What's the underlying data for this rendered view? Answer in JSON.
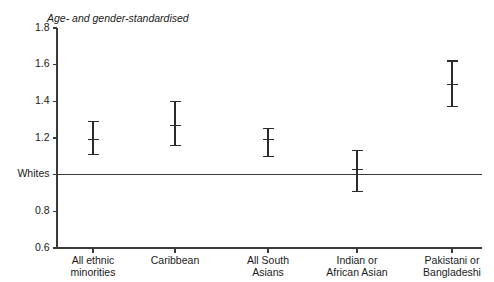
{
  "chart_data": {
    "type": "scatter",
    "title": "Age- and gender-standardised",
    "xlabel": "",
    "ylabel": "",
    "ylim": [
      0.6,
      1.8
    ],
    "grid": false,
    "legend": null,
    "y_ticks": [
      {
        "value": 1.8,
        "label": "1.8"
      },
      {
        "value": 1.6,
        "label": "1.6"
      },
      {
        "value": 1.4,
        "label": "1.4"
      },
      {
        "value": 1.2,
        "label": "1.2"
      },
      {
        "value": 1.0,
        "label": "Whites"
      },
      {
        "value": 0.8,
        "label": "0.8"
      },
      {
        "value": 0.6,
        "label": "0.6"
      }
    ],
    "reference_line": {
      "value": 1.0,
      "label": "Whites"
    },
    "categories": [
      "All ethnic minorities",
      "Caribbean",
      "All South Asians",
      "Indian or African Asian",
      "Pakistani or Bangladeshi"
    ],
    "category_label_lines": [
      [
        "All ethnic",
        "minorities"
      ],
      [
        "Caribbean"
      ],
      [
        "All South",
        "Asians"
      ],
      [
        "Indian or",
        "African Asian"
      ],
      [
        "Pakistani or",
        "Bangladeshi"
      ]
    ],
    "values": [
      1.19,
      1.27,
      1.19,
      1.03,
      1.49
    ],
    "ci_low": [
      1.11,
      1.16,
      1.1,
      0.91,
      1.37
    ],
    "ci_high": [
      1.29,
      1.4,
      1.25,
      1.13,
      1.62
    ],
    "points": [
      {
        "category": "All ethnic minorities",
        "value": 1.19,
        "low": 1.11,
        "high": 1.29
      },
      {
        "category": "Caribbean",
        "value": 1.27,
        "low": 1.16,
        "high": 1.4
      },
      {
        "category": "All South Asians",
        "value": 1.19,
        "low": 1.1,
        "high": 1.25
      },
      {
        "category": "Indian or African Asian",
        "value": 1.03,
        "low": 0.91,
        "high": 1.13
      },
      {
        "category": "Pakistani or Bangladeshi",
        "value": 1.49,
        "low": 1.37,
        "high": 1.62
      }
    ],
    "colors": {
      "axis": "#3a3a3a",
      "marker": "#2b2b2b",
      "text": "#1a1a1a",
      "background": "#ffffff"
    }
  }
}
